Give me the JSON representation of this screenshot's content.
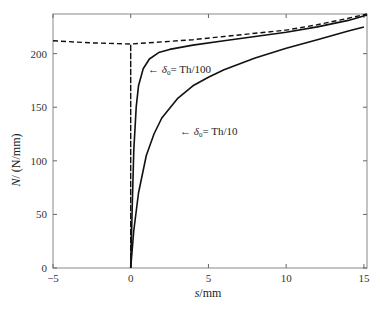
{
  "chart_data": {
    "type": "line",
    "title": "",
    "xlabel": "s/mm",
    "ylabel": "N/ (N/mm)",
    "xlim": [
      -5,
      15.2
    ],
    "ylim": [
      0,
      237
    ],
    "xticks": [
      -5,
      0,
      5,
      10,
      15
    ],
    "yticks": [
      0,
      50,
      100,
      150,
      200
    ],
    "grid": false,
    "legend": null,
    "series": [
      {
        "name": "envelope (dashed)",
        "style": "dashed",
        "x": [
          -5,
          -2.5,
          0,
          0,
          0,
          2,
          4,
          6,
          8,
          10,
          12,
          14,
          15.2
        ],
        "y": [
          212,
          210,
          209,
          0,
          209,
          211,
          213,
          216,
          219,
          222,
          227,
          233,
          237
        ]
      },
      {
        "name": "δ0 = Th/100",
        "style": "solid",
        "x": [
          0,
          0.1,
          0.2,
          0.35,
          0.5,
          0.8,
          1.2,
          1.8,
          2.5,
          4,
          6,
          8,
          10,
          12,
          14,
          15.2
        ],
        "y": [
          0,
          60,
          110,
          150,
          170,
          186,
          195,
          201,
          204,
          208,
          212,
          216,
          220,
          225,
          231,
          236
        ]
      },
      {
        "name": "δ0 = Th/10",
        "style": "solid",
        "x": [
          0,
          0.2,
          0.5,
          1,
          1.5,
          2,
          3,
          4,
          5,
          6,
          8,
          10,
          12,
          14,
          15
        ],
        "y": [
          0,
          35,
          70,
          105,
          125,
          140,
          158,
          170,
          178,
          185,
          196,
          205,
          213,
          221,
          225
        ]
      }
    ],
    "annotations": [
      {
        "text": "← δ0= Th/100",
        "x": 1.2,
        "y": 184
      },
      {
        "text": "← δ0= Th/10",
        "x": 3.2,
        "y": 127
      }
    ]
  },
  "labels": {
    "x_axis": "s/mm",
    "y_axis": "N/ (N/mm)",
    "annot1_arrow": "←",
    "annot1_delta": "δ",
    "annot1_sub": "0",
    "annot1_rest": "= Th/100",
    "annot2_arrow": "←",
    "annot2_delta": "δ",
    "annot2_sub": "0",
    "annot2_rest": "= Th/10"
  }
}
